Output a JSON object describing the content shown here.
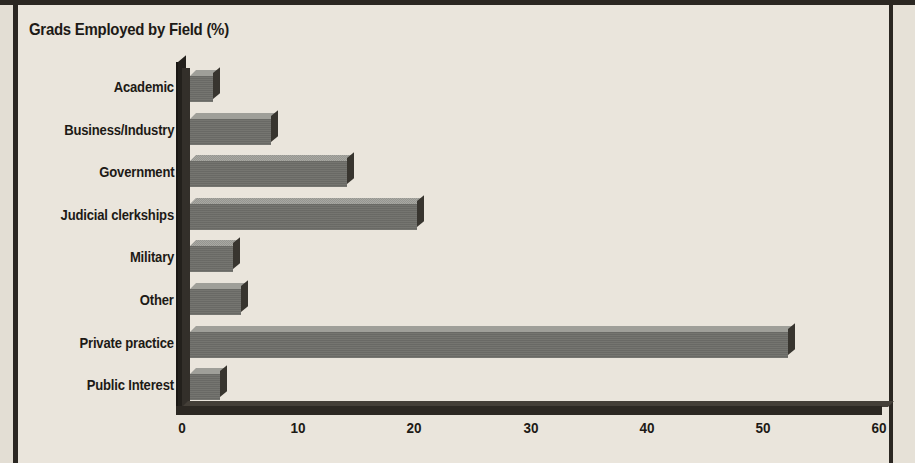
{
  "page": {
    "background_color": "#eae5dc",
    "border_color": "#2b2722"
  },
  "chart_data": {
    "type": "bar",
    "orientation": "horizontal",
    "style": "3d",
    "title": "Grads Employed by Field (%)",
    "xlabel": "",
    "ylabel": "",
    "xlim": [
      0,
      60
    ],
    "grid": false,
    "legend": null,
    "xticks": [
      "0",
      "10",
      "20",
      "30",
      "40",
      "50",
      "60"
    ],
    "xtick_values": [
      0,
      10,
      20,
      30,
      40,
      50,
      60
    ],
    "categories": [
      "Academic",
      "Business/Industry",
      "Government",
      "Judicial clerkships",
      "Military",
      "Other",
      "Private practice",
      "Public Interest"
    ],
    "values": [
      2,
      7,
      13.5,
      19.5,
      3.7,
      4.4,
      51.5,
      2.6
    ],
    "colors": {
      "bar_front": "#6f6f6a",
      "bar_top": "#9c9c96",
      "bar_cap": "#38352f",
      "axis": "#2c2823",
      "text": "#1d1a16"
    }
  }
}
